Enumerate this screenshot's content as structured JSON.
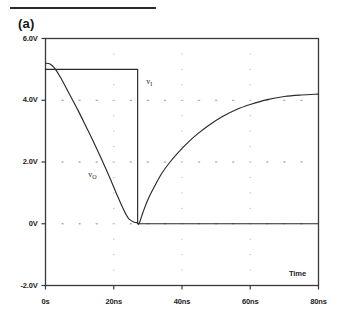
{
  "figure": {
    "panel_label": "(a)",
    "rule_color": "#2b2b2b"
  },
  "chart_data": {
    "type": "line",
    "title": "",
    "subtitle": "",
    "xlabel": "Time",
    "ylabel": "",
    "xlim": [
      0,
      80
    ],
    "ylim": [
      -2.0,
      6.0
    ],
    "x_unit": "ns",
    "y_unit": "V",
    "grid": "dotted",
    "grid_color": "#8a8a8a",
    "legend": "inline-annotations",
    "axis_color": "#3a3a3a",
    "curve_color": "#2a2a2a",
    "xticks": [
      0,
      20,
      40,
      60,
      80
    ],
    "xtick_labels": [
      "0s",
      "20ns",
      "40ns",
      "60ns",
      "80ns"
    ],
    "yticks": [
      -2.0,
      0.0,
      2.0,
      4.0,
      6.0
    ],
    "ytick_labels": [
      "-2.0V",
      "0V",
      "2.0V",
      "4.0V",
      "6.0V"
    ],
    "annotations": [
      {
        "name": "v_I",
        "text": "v",
        "sub": "I",
        "x": 29.5,
        "y": 4.55
      },
      {
        "name": "v_O",
        "text": "v",
        "sub": "O",
        "x": 12.5,
        "y": 1.55
      }
    ],
    "series": [
      {
        "name": "v_I",
        "label": "v_I",
        "description": "Input pulse: holds 5.0 V then falls to 0 V at 27 ns",
        "x": [
          0,
          27,
          27,
          80
        ],
        "values": [
          5.0,
          5.0,
          0.0,
          0.0
        ]
      },
      {
        "name": "v_O",
        "label": "v_O",
        "description": "Output: decays from 5.2 V to 0 V by 24 ns, flat until 27 ns, then charges back toward 5 V reaching 4.2 V at 80 ns",
        "x": [
          0,
          1.2,
          2.6,
          4.5,
          7.0,
          9.5,
          12.0,
          14.5,
          17.0,
          19.0,
          21.0,
          22.5,
          23.5,
          24.5,
          26.0,
          27.0,
          27.4,
          28.5,
          30.0,
          32.0,
          34.0,
          36.5,
          39.0,
          42.0,
          45.0,
          48.0,
          52.0,
          56.0,
          60.0,
          65.0,
          70.0,
          75.0,
          80.0
        ],
        "values": [
          5.2,
          5.18,
          5.05,
          4.72,
          4.2,
          3.68,
          3.12,
          2.55,
          1.95,
          1.45,
          0.92,
          0.55,
          0.32,
          0.15,
          0.05,
          0.03,
          0.0,
          0.35,
          0.78,
          1.22,
          1.62,
          2.0,
          2.32,
          2.66,
          2.95,
          3.2,
          3.48,
          3.7,
          3.86,
          4.02,
          4.12,
          4.17,
          4.2
        ]
      }
    ]
  }
}
